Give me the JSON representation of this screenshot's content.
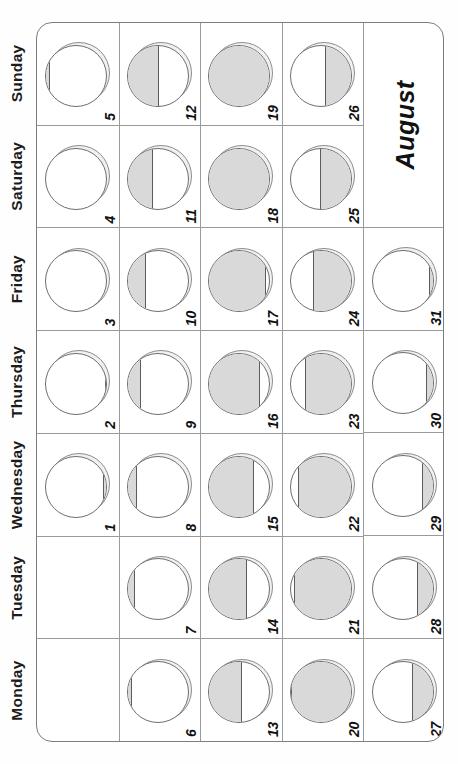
{
  "month": {
    "title": "August"
  },
  "weekday_headers": [
    "Monday",
    "Tuesday",
    "Wednesday",
    "Thursday",
    "Friday",
    "Saturday",
    "Sunday"
  ],
  "colors": {
    "page_background": "#fefefe",
    "grid_line": "#9a9a9a",
    "grid_border": "#7d7d7d",
    "moon_lit": "#d9d9d9",
    "moon_dark": "#ffffff",
    "moon_outline": "#6e6e6e",
    "moon_shadow": "#f1f1f1",
    "text": "#111111"
  },
  "weeks": [
    {
      "index": 1,
      "days": [
        {
          "num": "",
          "empty": true,
          "moon": null
        },
        {
          "num": "",
          "empty": true,
          "moon": null
        },
        {
          "num": "1",
          "empty": false,
          "moon": {
            "phase": "waning crescent",
            "lit_side": "bottom",
            "lit_fraction": 0.04
          }
        },
        {
          "num": "2",
          "empty": false,
          "moon": {
            "phase": "waning crescent",
            "lit_side": "bottom",
            "lit_fraction": 0.02
          }
        },
        {
          "num": "3",
          "empty": false,
          "moon": {
            "phase": "new moon",
            "lit_side": "none",
            "lit_fraction": 0.0
          }
        },
        {
          "num": "4",
          "empty": false,
          "moon": {
            "phase": "new moon",
            "lit_side": "top",
            "lit_fraction": 0.01
          }
        },
        {
          "num": "5",
          "empty": false,
          "moon": {
            "phase": "waxing crescent",
            "lit_side": "top",
            "lit_fraction": 0.06
          }
        }
      ]
    },
    {
      "index": 2,
      "days": [
        {
          "num": "6",
          "empty": false,
          "moon": {
            "phase": "waxing crescent",
            "lit_side": "top",
            "lit_fraction": 0.07
          }
        },
        {
          "num": "7",
          "empty": false,
          "moon": {
            "phase": "waxing crescent",
            "lit_side": "top",
            "lit_fraction": 0.11
          }
        },
        {
          "num": "8",
          "empty": false,
          "moon": {
            "phase": "waxing crescent",
            "lit_side": "top",
            "lit_fraction": 0.15
          }
        },
        {
          "num": "9",
          "empty": false,
          "moon": {
            "phase": "waxing crescent",
            "lit_side": "top",
            "lit_fraction": 0.21
          }
        },
        {
          "num": "10",
          "empty": false,
          "moon": {
            "phase": "waxing crescent",
            "lit_side": "top",
            "lit_fraction": 0.3
          }
        },
        {
          "num": "11",
          "empty": false,
          "moon": {
            "phase": "waxing crescent",
            "lit_side": "top",
            "lit_fraction": 0.41
          }
        },
        {
          "num": "12",
          "empty": false,
          "moon": {
            "phase": "first quarter",
            "lit_side": "top",
            "lit_fraction": 0.5
          }
        }
      ]
    },
    {
      "index": 3,
      "days": [
        {
          "num": "13",
          "empty": false,
          "moon": {
            "phase": "waxing gibbous",
            "lit_side": "top",
            "lit_fraction": 0.53
          }
        },
        {
          "num": "14",
          "empty": false,
          "moon": {
            "phase": "waxing gibbous",
            "lit_side": "top",
            "lit_fraction": 0.6
          }
        },
        {
          "num": "15",
          "empty": false,
          "moon": {
            "phase": "waxing gibbous",
            "lit_side": "top",
            "lit_fraction": 0.71
          }
        },
        {
          "num": "16",
          "empty": false,
          "moon": {
            "phase": "waxing gibbous",
            "lit_side": "top",
            "lit_fraction": 0.82
          }
        },
        {
          "num": "17",
          "empty": false,
          "moon": {
            "phase": "waxing gibbous",
            "lit_side": "top",
            "lit_fraction": 0.91
          }
        },
        {
          "num": "18",
          "empty": false,
          "moon": {
            "phase": "full moon",
            "lit_side": "full",
            "lit_fraction": 1.0
          }
        },
        {
          "num": "19",
          "empty": false,
          "moon": {
            "phase": "full moon",
            "lit_side": "full",
            "lit_fraction": 1.0
          }
        }
      ]
    },
    {
      "index": 4,
      "days": [
        {
          "num": "20",
          "empty": false,
          "moon": {
            "phase": "waning gibbous",
            "lit_side": "bottom",
            "lit_fraction": 0.97
          }
        },
        {
          "num": "21",
          "empty": false,
          "moon": {
            "phase": "waning gibbous",
            "lit_side": "bottom",
            "lit_fraction": 0.92
          }
        },
        {
          "num": "22",
          "empty": false,
          "moon": {
            "phase": "waning gibbous",
            "lit_side": "bottom",
            "lit_fraction": 0.85
          }
        },
        {
          "num": "23",
          "empty": false,
          "moon": {
            "phase": "waning gibbous",
            "lit_side": "bottom",
            "lit_fraction": 0.74
          }
        },
        {
          "num": "24",
          "empty": false,
          "moon": {
            "phase": "waning gibbous",
            "lit_side": "bottom",
            "lit_fraction": 0.62
          }
        },
        {
          "num": "25",
          "empty": false,
          "moon": {
            "phase": "last quarter",
            "lit_side": "bottom",
            "lit_fraction": 0.5
          }
        },
        {
          "num": "26",
          "empty": false,
          "moon": {
            "phase": "waning crescent",
            "lit_side": "bottom",
            "lit_fraction": 0.42
          }
        }
      ]
    },
    {
      "index": 5,
      "days": [
        {
          "num": "27",
          "empty": false,
          "moon": {
            "phase": "waning crescent",
            "lit_side": "bottom",
            "lit_fraction": 0.33
          }
        },
        {
          "num": "28",
          "empty": false,
          "moon": {
            "phase": "waning crescent",
            "lit_side": "bottom",
            "lit_fraction": 0.25
          }
        },
        {
          "num": "29",
          "empty": false,
          "moon": {
            "phase": "waning crescent",
            "lit_side": "bottom",
            "lit_fraction": 0.18
          }
        },
        {
          "num": "30",
          "empty": false,
          "moon": {
            "phase": "waning crescent",
            "lit_side": "bottom",
            "lit_fraction": 0.11
          }
        },
        {
          "num": "31",
          "empty": false,
          "moon": {
            "phase": "waning crescent",
            "lit_side": "bottom",
            "lit_fraction": 0.06
          }
        },
        {
          "num": "",
          "empty": true,
          "merged": true,
          "title": "August",
          "moon": null
        }
      ]
    }
  ]
}
